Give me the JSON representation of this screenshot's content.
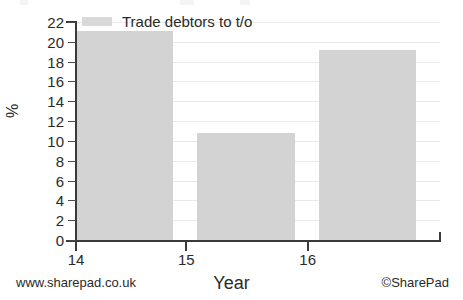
{
  "chart_data": {
    "type": "bar",
    "title": "",
    "subtitle": "",
    "xlabel": "Year",
    "ylabel": "%",
    "categories": [
      "14",
      "15",
      "16"
    ],
    "series": [
      {
        "name": "Trade debtors to t/o",
        "values": [
          21.1,
          10.8,
          19.2
        ],
        "color": "#d3d3d3"
      }
    ],
    "ylim": [
      0,
      22
    ],
    "ytick_values": [
      0,
      2,
      4,
      6,
      8,
      10,
      12,
      14,
      16,
      18,
      20,
      22
    ],
    "ytick_labels": [
      "0",
      "2",
      "4",
      "6",
      "8",
      "10",
      "12",
      "14",
      "16",
      "18",
      "20",
      "22"
    ],
    "xtick_labels": [
      "14",
      "15",
      "16"
    ],
    "grid": true,
    "grid_axis": "y",
    "grid_color": "#e9e9e9",
    "legend_position": "top-left",
    "legend_entries": [
      "Trade debtors to t/o"
    ],
    "annotations": []
  },
  "legend": {
    "label": "Trade debtors to t/o",
    "swatch_color": "#d3d3d3"
  },
  "axes": {
    "y_title": "%",
    "x_title": "Year",
    "axis_color": "#3a3a3a"
  },
  "footer": {
    "left": "www.sharepad.co.uk",
    "right": "©SharePad"
  }
}
